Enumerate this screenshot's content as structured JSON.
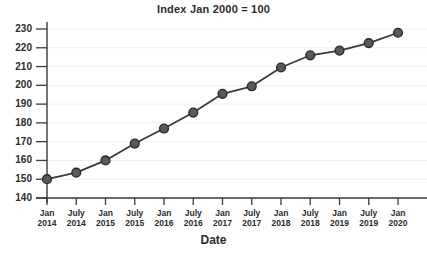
{
  "chart_data": {
    "type": "line",
    "title": "Index Jan 2000 = 100",
    "xlabel": "Date",
    "ylabel": "",
    "grid": true,
    "legend": "none",
    "ylim": [
      140,
      230
    ],
    "ytick_labels": [
      "230",
      "220",
      "210",
      "200",
      "190",
      "180",
      "170",
      "160",
      "150",
      "140"
    ],
    "yticks": [
      230,
      220,
      210,
      200,
      190,
      180,
      170,
      160,
      150,
      140
    ],
    "categories": [
      "Jan 2014",
      "July 2014",
      "Jan 2015",
      "July 2015",
      "Jan 2016",
      "July 2016",
      "Jan 2017",
      "July 2017",
      "Jan 2018",
      "July 2018",
      "Jan 2019",
      "July 2019",
      "Jan 2020"
    ],
    "xtick_labels": [
      {
        "month": "Jan",
        "year": "2014"
      },
      {
        "month": "July",
        "year": "2014"
      },
      {
        "month": "Jan",
        "year": "2015"
      },
      {
        "month": "July",
        "year": "2015"
      },
      {
        "month": "Jan",
        "year": "2016"
      },
      {
        "month": "July",
        "year": "2016"
      },
      {
        "month": "Jan",
        "year": "2017"
      },
      {
        "month": "July",
        "year": "2017"
      },
      {
        "month": "Jan",
        "year": "2018"
      },
      {
        "month": "July",
        "year": "2018"
      },
      {
        "month": "Jan",
        "year": "2019"
      },
      {
        "month": "July",
        "year": "2019"
      },
      {
        "month": "Jan",
        "year": "2020"
      }
    ],
    "values": [
      150,
      153.5,
      160,
      169,
      177,
      185.5,
      195.5,
      199.5,
      209.5,
      216,
      218.5,
      222.5,
      228
    ],
    "series": [
      {
        "name": "Index",
        "values": [
          150,
          153.5,
          160,
          169,
          177,
          185.5,
          195.5,
          199.5,
          209.5,
          216,
          218.5,
          222.5,
          228
        ]
      }
    ],
    "colors": {
      "line": "#3a3a3a",
      "marker_fill": "#595959",
      "marker_edge": "#2b2b2b",
      "grid": "#f0f0f0",
      "axis": "#3a3a3a",
      "text": "#2b2b2b",
      "background": "#ffffff"
    }
  }
}
